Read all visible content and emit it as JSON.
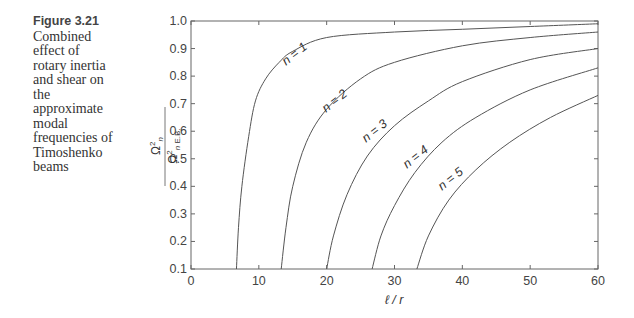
{
  "caption": {
    "figure_label": "Figure 3.21",
    "text": "Combined effect of rotary inertia and shear on the approximate modal frequencies of Timoshenko beams"
  },
  "chart_data": {
    "type": "line",
    "title": "",
    "xlabel": "ℓ / r",
    "ylabel": "Ω²n / Ω²n E.B.",
    "xlim": [
      0,
      60
    ],
    "ylim": [
      0.1,
      1.0
    ],
    "xticks": [
      0,
      10,
      20,
      30,
      40,
      50,
      60
    ],
    "yticks": [
      0.1,
      0.2,
      0.3,
      0.4,
      0.5,
      0.6,
      0.7,
      0.8,
      0.9,
      1.0
    ],
    "grid": false,
    "legend": "inline labels on curves",
    "series": [
      {
        "name": "n = 1",
        "label_pos": [
          297,
          57
        ],
        "points": [
          [
            6.7,
            0.1
          ],
          [
            7,
            0.25
          ],
          [
            7.5,
            0.4
          ],
          [
            8.5,
            0.58
          ],
          [
            9.5,
            0.71
          ],
          [
            11,
            0.79
          ],
          [
            13,
            0.85
          ],
          [
            15,
            0.89
          ],
          [
            20,
            0.94
          ],
          [
            30,
            0.96
          ],
          [
            40,
            0.97
          ],
          [
            50,
            0.98
          ],
          [
            60,
            0.99
          ]
        ]
      },
      {
        "name": "n = 2",
        "label_pos": [
          337,
          104
        ],
        "points": [
          [
            13.3,
            0.1
          ],
          [
            14,
            0.25
          ],
          [
            15,
            0.4
          ],
          [
            17,
            0.56
          ],
          [
            20,
            0.68
          ],
          [
            25,
            0.79
          ],
          [
            30,
            0.85
          ],
          [
            40,
            0.91
          ],
          [
            50,
            0.94
          ],
          [
            60,
            0.96
          ]
        ]
      },
      {
        "name": "n = 3",
        "label_pos": [
          377,
          134
        ],
        "points": [
          [
            20,
            0.1
          ],
          [
            21,
            0.22
          ],
          [
            23,
            0.37
          ],
          [
            26,
            0.51
          ],
          [
            30,
            0.62
          ],
          [
            35,
            0.71
          ],
          [
            40,
            0.78
          ],
          [
            50,
            0.86
          ],
          [
            60,
            0.9
          ]
        ]
      },
      {
        "name": "n = 4",
        "label_pos": [
          418,
          160
        ],
        "points": [
          [
            26.7,
            0.1
          ],
          [
            28,
            0.22
          ],
          [
            30,
            0.33
          ],
          [
            33,
            0.45
          ],
          [
            37,
            0.56
          ],
          [
            42,
            0.65
          ],
          [
            50,
            0.75
          ],
          [
            60,
            0.83
          ]
        ]
      },
      {
        "name": "n = 5",
        "label_pos": [
          453,
          182
        ],
        "points": [
          [
            33.3,
            0.1
          ],
          [
            35,
            0.22
          ],
          [
            38,
            0.35
          ],
          [
            42,
            0.46
          ],
          [
            47,
            0.56
          ],
          [
            53,
            0.65
          ],
          [
            60,
            0.73
          ]
        ]
      }
    ]
  }
}
